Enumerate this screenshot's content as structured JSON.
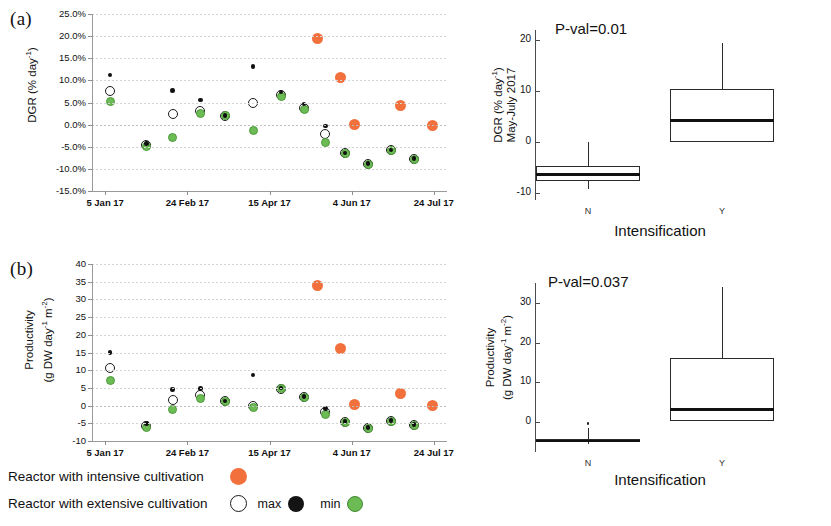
{
  "figure": {
    "panels": [
      {
        "id": "a",
        "letter": "(a)"
      },
      {
        "id": "b",
        "letter": "(b)"
      }
    ]
  },
  "legend": {
    "rows": [
      {
        "label": "Reactor with intensive cultivation",
        "marker": "orange-filled-circle"
      },
      {
        "label": "Reactor with extensive cultivation",
        "marker": "open-circle"
      }
    ],
    "max_label": "max",
    "max_marker": "black-filled-circle",
    "min_label": "min",
    "min_marker": "green-filled-circle"
  },
  "colors": {
    "intensive": "#f1703c",
    "min_green": "#6cbb55",
    "max_black": "#101010",
    "open_outline": "#1a1a1a",
    "grid": "#d4d4d4",
    "axis": "#9a9a9a"
  },
  "chart_data": [
    {
      "id": "panel-a-scatter",
      "type": "scatter",
      "title": "",
      "ylabel": "DGR (% day-1)",
      "ylabel_parts": {
        "main": "DGR (% day",
        "sup": "-1",
        "tail": ")"
      },
      "xlabel": "",
      "ylim": [
        -15,
        25
      ],
      "yticks": [
        25,
        20,
        15,
        10,
        5,
        0,
        -5,
        -10,
        -15
      ],
      "ytick_labels": [
        "25.0%",
        "20.0%",
        "15.0%",
        "10.0%",
        "5.0%",
        "0.0%",
        "-5.0%",
        "-10.0%",
        "-15.0%"
      ],
      "xtick_labels": [
        "5 Jan 17",
        "24 Feb 17",
        "15 Apr 17",
        "4 Jun 17",
        "24 Jul 17"
      ],
      "xtick_days": [
        0,
        50,
        100,
        150,
        200
      ],
      "xlim_days": [
        -8,
        208
      ],
      "grid": true,
      "series": [
        {
          "name": "max",
          "marker": "black-filled-circle",
          "color": "#101010",
          "points": [
            {
              "x": 3,
              "y": 11.2
            },
            {
              "x": 25,
              "y": -4.2
            },
            {
              "x": 41,
              "y": 7.7
            },
            {
              "x": 58,
              "y": 5.6
            },
            {
              "x": 73,
              "y": 2.1
            },
            {
              "x": 90,
              "y": 13.2
            },
            {
              "x": 107,
              "y": 7.4
            },
            {
              "x": 121,
              "y": 4.7
            },
            {
              "x": 134,
              "y": -0.3
            },
            {
              "x": 146,
              "y": -6.4
            },
            {
              "x": 160,
              "y": -8.8
            },
            {
              "x": 174,
              "y": -5.7
            },
            {
              "x": 188,
              "y": -7.6
            }
          ]
        },
        {
          "name": "extensive (mean)",
          "marker": "open-circle",
          "color": "#ffffff",
          "points": [
            {
              "x": 3,
              "y": 7.7
            },
            {
              "x": 25,
              "y": -4.5
            },
            {
              "x": 41,
              "y": 2.3
            },
            {
              "x": 58,
              "y": 3.1
            },
            {
              "x": 73,
              "y": 2.0
            },
            {
              "x": 90,
              "y": 5.0
            },
            {
              "x": 107,
              "y": 6.8
            },
            {
              "x": 121,
              "y": 3.7
            },
            {
              "x": 134,
              "y": -2.2
            },
            {
              "x": 146,
              "y": -6.5
            },
            {
              "x": 160,
              "y": -8.9
            },
            {
              "x": 174,
              "y": -5.8
            },
            {
              "x": 188,
              "y": -7.7
            }
          ]
        },
        {
          "name": "min",
          "marker": "green-filled-circle",
          "color": "#6cbb55",
          "points": [
            {
              "x": 3,
              "y": 5.2
            },
            {
              "x": 25,
              "y": -5.0
            },
            {
              "x": 41,
              "y": -2.8
            },
            {
              "x": 58,
              "y": 2.5
            },
            {
              "x": 73,
              "y": 2.0
            },
            {
              "x": 90,
              "y": -1.4
            },
            {
              "x": 107,
              "y": 6.3
            },
            {
              "x": 121,
              "y": 3.4
            },
            {
              "x": 134,
              "y": -4.1
            },
            {
              "x": 146,
              "y": -6.6
            },
            {
              "x": 160,
              "y": -9.0
            },
            {
              "x": 174,
              "y": -5.9
            },
            {
              "x": 188,
              "y": -7.8
            }
          ]
        },
        {
          "name": "Reactor with intensive cultivation",
          "marker": "orange-filled-circle",
          "color": "#f1703c",
          "points": [
            {
              "x": 129,
              "y": 19.5
            },
            {
              "x": 143,
              "y": 10.6
            },
            {
              "x": 152,
              "y": 0.1
            },
            {
              "x": 180,
              "y": 4.3
            },
            {
              "x": 199,
              "y": -0.2
            }
          ]
        }
      ]
    },
    {
      "id": "panel-a-boxplot",
      "type": "box",
      "title": "P-val=0.01",
      "pvalue_label": "P-val=0.01",
      "ylabel": "DGR (% day-1) May-July 2017",
      "ylabel_line1": "DGR (% day",
      "ylabel_line1_sup": "-1",
      "ylabel_line1_tail": ")",
      "ylabel_line2": "May-July 2017",
      "xlabel": "Intensification",
      "ylim": [
        -11,
        22
      ],
      "yticks": [
        20,
        10,
        0,
        -10
      ],
      "ytick_labels": [
        "20",
        "10",
        "0",
        "-10"
      ],
      "categories": [
        "N",
        "Y"
      ],
      "boxes": [
        {
          "category": "N",
          "whisker_low": -9.2,
          "q1": -7.6,
          "median": -6.3,
          "q3": -4.7,
          "whisker_high": 0.0,
          "outliers": []
        },
        {
          "category": "Y",
          "whisker_low": 0.1,
          "q1": 0.1,
          "median": 4.3,
          "q3": 10.5,
          "whisker_high": 19.5,
          "outliers": []
        }
      ]
    },
    {
      "id": "panel-b-scatter",
      "type": "scatter",
      "title": "",
      "ylabel": "Productivity (g DW day-1 m-2)",
      "ylabel_line1": "Productivity",
      "ylabel_line2_main": "(g DW day",
      "ylabel_line2_sup1": "-1",
      "ylabel_line2_mid": " m",
      "ylabel_line2_sup2": "-2",
      "ylabel_line2_tail": ")",
      "ylim": [
        -10,
        40
      ],
      "yticks": [
        40,
        35,
        30,
        25,
        20,
        15,
        10,
        5,
        0,
        -5,
        -10
      ],
      "ytick_labels": [
        "40",
        "35",
        "30",
        "25",
        "20",
        "15",
        "10",
        "5",
        "0",
        "-5",
        "-10"
      ],
      "xtick_labels": [
        "5 Jan 17",
        "24 Feb 17",
        "15 Apr 17",
        "4 Jun 17",
        "24 Jul 17"
      ],
      "xtick_days": [
        0,
        50,
        100,
        150,
        200
      ],
      "xlim_days": [
        -8,
        208
      ],
      "grid": true,
      "series": [
        {
          "name": "max",
          "marker": "black-filled-circle",
          "color": "#101010",
          "points": [
            {
              "x": 3,
              "y": 15.0
            },
            {
              "x": 25,
              "y": -5.0
            },
            {
              "x": 41,
              "y": 4.5
            },
            {
              "x": 58,
              "y": 4.8
            },
            {
              "x": 73,
              "y": 1.3
            },
            {
              "x": 90,
              "y": 8.7
            },
            {
              "x": 107,
              "y": 5.0
            },
            {
              "x": 121,
              "y": 2.6
            },
            {
              "x": 134,
              "y": -0.9
            },
            {
              "x": 146,
              "y": -4.5
            },
            {
              "x": 160,
              "y": -6.2
            },
            {
              "x": 174,
              "y": -4.2
            },
            {
              "x": 188,
              "y": -5.3
            }
          ]
        },
        {
          "name": "extensive (mean)",
          "marker": "open-circle",
          "color": "#ffffff",
          "points": [
            {
              "x": 3,
              "y": 10.5
            },
            {
              "x": 25,
              "y": -5.7
            },
            {
              "x": 41,
              "y": 1.6
            },
            {
              "x": 58,
              "y": 2.9
            },
            {
              "x": 73,
              "y": 1.2
            },
            {
              "x": 90,
              "y": -0.2
            },
            {
              "x": 107,
              "y": 4.8
            },
            {
              "x": 121,
              "y": 2.5
            },
            {
              "x": 134,
              "y": -1.7
            },
            {
              "x": 146,
              "y": -4.6
            },
            {
              "x": 160,
              "y": -6.3
            },
            {
              "x": 174,
              "y": -4.3
            },
            {
              "x": 188,
              "y": -5.4
            }
          ]
        },
        {
          "name": "min",
          "marker": "green-filled-circle",
          "color": "#6cbb55",
          "points": [
            {
              "x": 3,
              "y": 7.2
            },
            {
              "x": 25,
              "y": -6.3
            },
            {
              "x": 41,
              "y": -1.0
            },
            {
              "x": 58,
              "y": 2.0
            },
            {
              "x": 73,
              "y": 1.2
            },
            {
              "x": 90,
              "y": -0.4
            },
            {
              "x": 107,
              "y": 4.7
            },
            {
              "x": 121,
              "y": 2.4
            },
            {
              "x": 134,
              "y": -2.5
            },
            {
              "x": 146,
              "y": -4.7
            },
            {
              "x": 160,
              "y": -6.4
            },
            {
              "x": 174,
              "y": -4.4
            },
            {
              "x": 188,
              "y": -5.5
            }
          ]
        },
        {
          "name": "Reactor with intensive cultivation",
          "marker": "orange-filled-circle",
          "color": "#f1703c",
          "points": [
            {
              "x": 129,
              "y": 34.0
            },
            {
              "x": 143,
              "y": 16.0
            },
            {
              "x": 152,
              "y": 0.2
            },
            {
              "x": 180,
              "y": 3.3
            },
            {
              "x": 199,
              "y": 0.0
            }
          ]
        }
      ]
    },
    {
      "id": "panel-b-boxplot",
      "type": "box",
      "title": "P-val=0.037",
      "pvalue_label": "P-val=0.037",
      "ylabel": "Productivity (g DW day-1 m-2)",
      "ylabel_line1": "Productivity",
      "ylabel_line2_main": "(g DW day",
      "ylabel_line2_sup1": "-1",
      "ylabel_line2_mid": " m",
      "ylabel_line2_sup2": "-2",
      "ylabel_line2_tail": ")",
      "xlabel": "Intensification",
      "ylim": [
        -8,
        35
      ],
      "yticks": [
        30,
        20,
        10,
        0
      ],
      "ytick_labels": [
        "30",
        "20",
        "10",
        "0"
      ],
      "categories": [
        "N",
        "Y"
      ],
      "boxes": [
        {
          "category": "N",
          "whisker_low": -5.6,
          "q1": -5.2,
          "median": -4.8,
          "q3": -4.4,
          "whisker_high": -1.6,
          "outliers": [
            -0.4
          ]
        },
        {
          "category": "Y",
          "whisker_low": 0.1,
          "q1": 0.1,
          "median": 3.1,
          "q3": 16.0,
          "whisker_high": 34.0,
          "outliers": []
        }
      ]
    }
  ]
}
